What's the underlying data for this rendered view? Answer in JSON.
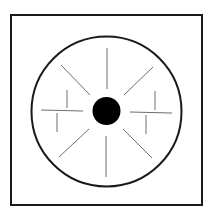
{
  "diagram": {
    "canvas": {
      "width": 212,
      "height": 215,
      "background": "#ffffff"
    },
    "frame": {
      "x": 11,
      "y": 15,
      "width": 191,
      "height": 190,
      "stroke": "#1a1a1a",
      "stroke_width": 2
    },
    "circle": {
      "cx": 106.5,
      "cy": 111.5,
      "r": 75,
      "stroke": "#1a1a1a",
      "stroke_width": 2
    },
    "center_dot": {
      "cx": 106.5,
      "cy": 111,
      "r": 14,
      "fill": "#000000"
    },
    "ray_color": "#6e6e6e",
    "rays": [
      {
        "name": "top",
        "x1": 107,
        "y1": 48,
        "x2": 107,
        "y2": 89
      },
      {
        "name": "bottom",
        "x1": 106,
        "y1": 136,
        "x2": 106,
        "y2": 177
      },
      {
        "name": "top-left",
        "x1": 61,
        "y1": 65,
        "x2": 90,
        "y2": 95
      },
      {
        "name": "top-right",
        "x1": 153,
        "y1": 67,
        "x2": 124,
        "y2": 95
      },
      {
        "name": "bottom-left",
        "x1": 89,
        "y1": 129,
        "x2": 59,
        "y2": 157
      },
      {
        "name": "bottom-right",
        "x1": 123,
        "y1": 129,
        "x2": 152,
        "y2": 158
      },
      {
        "name": "left-horizontal",
        "x1": 41,
        "y1": 110,
        "x2": 83,
        "y2": 111
      },
      {
        "name": "left-tick-upper",
        "x1": 67,
        "y1": 90,
        "x2": 67,
        "y2": 108
      },
      {
        "name": "left-tick-lower",
        "x1": 57,
        "y1": 113,
        "x2": 57,
        "y2": 132
      },
      {
        "name": "right-horizontal",
        "x1": 130,
        "y1": 112,
        "x2": 172,
        "y2": 113
      },
      {
        "name": "right-tick-upper",
        "x1": 155,
        "y1": 91,
        "x2": 155,
        "y2": 110
      },
      {
        "name": "right-tick-lower",
        "x1": 146,
        "y1": 115,
        "x2": 146,
        "y2": 134
      }
    ]
  }
}
